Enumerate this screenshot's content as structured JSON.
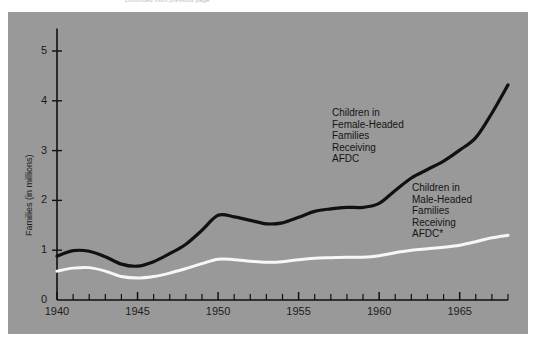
{
  "top_caption": "continued from previous page",
  "chart_data": {
    "type": "line",
    "title": "",
    "xlabel": "",
    "ylabel": "Families (in millions)",
    "xlim": [
      1940,
      1968
    ],
    "ylim": [
      0,
      5.4
    ],
    "y_ticks": [
      "0",
      "1",
      "2",
      "3",
      "4",
      "5"
    ],
    "y_tick_values": [
      0,
      1,
      2,
      3,
      4,
      5
    ],
    "x_ticks": [
      "1940",
      "1945",
      "1950",
      "1955",
      "1960",
      "1965"
    ],
    "x_tick_values": [
      1940,
      1945,
      1950,
      1955,
      1960,
      1965
    ],
    "minor_x_tick_interval": 1,
    "grid": false,
    "legend": "inline-annotations",
    "background_color": "#999999",
    "series": [
      {
        "name": "Children in Female-Headed Families Receiving AFDC",
        "color": "#111111",
        "x": [
          1940,
          1941,
          1942,
          1943,
          1944,
          1945,
          1946,
          1947,
          1948,
          1949,
          1950,
          1951,
          1952,
          1953,
          1954,
          1955,
          1956,
          1957,
          1958,
          1959,
          1960,
          1961,
          1962,
          1963,
          1964,
          1965,
          1966,
          1967,
          1968
        ],
        "values": [
          0.88,
          0.99,
          0.98,
          0.87,
          0.72,
          0.68,
          0.77,
          0.93,
          1.12,
          1.4,
          1.7,
          1.67,
          1.6,
          1.53,
          1.55,
          1.66,
          1.78,
          1.83,
          1.86,
          1.86,
          1.94,
          2.2,
          2.45,
          2.62,
          2.79,
          3.01,
          3.26,
          3.75,
          4.32
        ]
      },
      {
        "name": "Children in Male-Headed Families Receiving AFDC*",
        "color": "#f7f7f7",
        "x": [
          1940,
          1941,
          1942,
          1943,
          1944,
          1945,
          1946,
          1947,
          1948,
          1949,
          1950,
          1951,
          1952,
          1953,
          1954,
          1955,
          1956,
          1957,
          1958,
          1959,
          1960,
          1961,
          1962,
          1963,
          1964,
          1965,
          1966,
          1967,
          1968
        ],
        "values": [
          0.58,
          0.64,
          0.65,
          0.58,
          0.47,
          0.44,
          0.47,
          0.54,
          0.63,
          0.73,
          0.82,
          0.81,
          0.78,
          0.76,
          0.77,
          0.81,
          0.84,
          0.85,
          0.86,
          0.86,
          0.89,
          0.95,
          1.0,
          1.03,
          1.06,
          1.1,
          1.17,
          1.25,
          1.3
        ]
      }
    ],
    "annotations": [
      {
        "id": "female-headed",
        "text": "Children in\nFemale-Headed\nFamilies\nReceiving\nAFDC",
        "x_px": 332,
        "y_px": 107
      },
      {
        "id": "male-headed",
        "text": "Children in\nMale-Headed\nFamilies\nReceiving\nAFDC*",
        "x_px": 412,
        "y_px": 182
      }
    ]
  }
}
